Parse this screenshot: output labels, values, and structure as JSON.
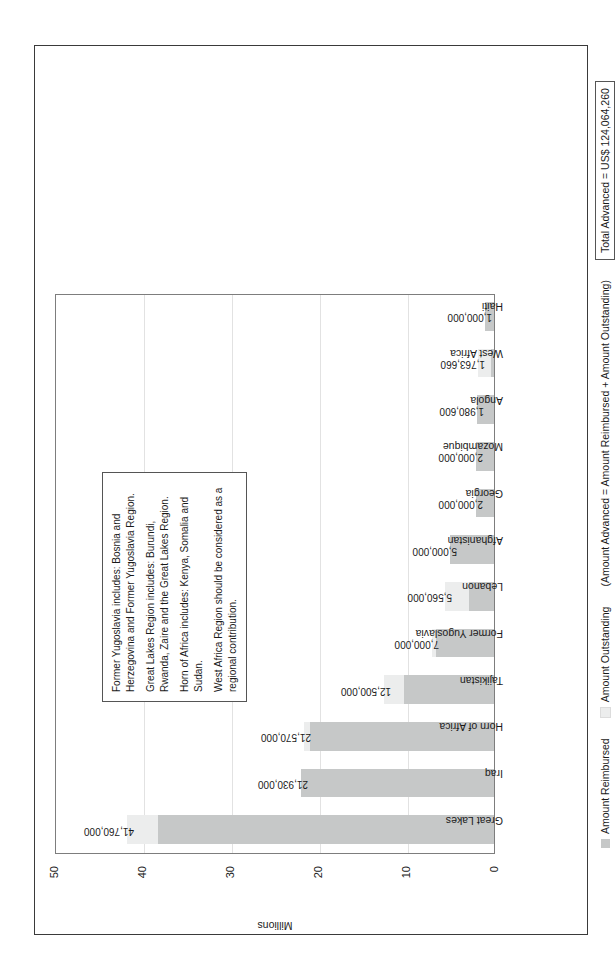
{
  "chart_data": {
    "type": "bar",
    "subtype": "stacked-vertical",
    "title": "",
    "xlabel": "",
    "ylabel": "Millions",
    "ylim": [
      0,
      50
    ],
    "yticks": [
      "0",
      "10",
      "20",
      "30",
      "40",
      "50"
    ],
    "grid": true,
    "legend_position": "bottom",
    "categories": [
      "Great Lakes",
      "Iraq",
      "Horn of Africa",
      "Tajikistan",
      "Former Yugoslavia",
      "Lebanon",
      "Afghanistan",
      "Georgia",
      "Mozambique",
      "Angola",
      "West Africa",
      "Haiti"
    ],
    "data_labels": [
      "41,760,000",
      "21,930,000",
      "21,570,000",
      "12,500,000",
      "7,000,000",
      "5,560,000",
      "5,000,000",
      "2,000,000",
      "2,000,000",
      "1,980,600",
      "1,763,660",
      "1,000,000"
    ],
    "totals": [
      41760000,
      21930000,
      21570000,
      12500000,
      7000000,
      5560000,
      5000000,
      2000000,
      2000000,
      1980600,
      1763660,
      1000000
    ],
    "series": [
      {
        "name": "Amount Reimbursed",
        "color": "#c6c8c8",
        "values": [
          38200000,
          21930000,
          20900000,
          10200000,
          6600000,
          2800000,
          5000000,
          2000000,
          2000000,
          1980600,
          380000,
          1000000
        ]
      },
      {
        "name": "Amount Outstanding",
        "color": "#eceded",
        "values": [
          3560000,
          0,
          670000,
          2300000,
          400000,
          2760000,
          0,
          0,
          0,
          0,
          1383660,
          0
        ]
      }
    ]
  },
  "legend": {
    "items": [
      {
        "label": "Amount Reimbursed",
        "color": "#c6c8c8"
      },
      {
        "label": "Amount Outstanding",
        "color": "#eceded"
      }
    ],
    "formula": "(Amount Advanced = Amount Reimbursed + Amount Outstanding)",
    "total_label": "Total Advanced = US$ 124,064,260"
  },
  "notes": {
    "lines": [
      "Former Yugoslavia includes: Bosnia and Herzegovina and Former Yugoslavia Region.",
      "Great Lakes Region includes: Burundi, Rwanda, Zaire and the Great Lakes Region.",
      "Horn of Africa includes: Kenya, Somalia and Sudan.",
      "West Africa Region should be considered as a regional contribution."
    ]
  },
  "colors": {
    "reimbursed": "#c6c8c8",
    "outstanding": "#eceded",
    "frame": "#3a3a3a",
    "axis": "#7d7d7d",
    "grid": "#e2e2e2"
  }
}
